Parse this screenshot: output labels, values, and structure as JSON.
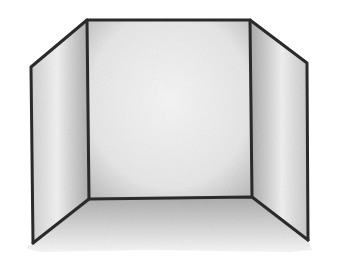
{
  "image": {
    "description": "Pencil-shaded line drawing of a three-panel tri-fold board forming an open box/room corner",
    "colors": {
      "background": "#ffffff",
      "outline": "#2a2a2a",
      "panel_light": "#f2f2f2",
      "panel_shade": "#a8a8a8",
      "floor_shade": "#b5b5b5"
    },
    "panels": [
      {
        "name": "left",
        "points": [
          [
            31,
            67
          ],
          [
            87,
            20
          ],
          [
            89,
            199
          ],
          [
            33,
            243
          ]
        ]
      },
      {
        "name": "back",
        "points": [
          [
            87,
            20
          ],
          [
            250,
            20
          ],
          [
            252,
            197
          ],
          [
            89,
            199
          ]
        ]
      },
      {
        "name": "right",
        "points": [
          [
            250,
            20
          ],
          [
            307,
            63
          ],
          [
            308,
            240
          ],
          [
            252,
            197
          ]
        ]
      }
    ],
    "floor": {
      "points": [
        [
          33,
          243
        ],
        [
          89,
          199
        ],
        [
          252,
          197
        ],
        [
          308,
          240
        ],
        [
          300,
          250
        ],
        [
          40,
          250
        ]
      ]
    }
  }
}
